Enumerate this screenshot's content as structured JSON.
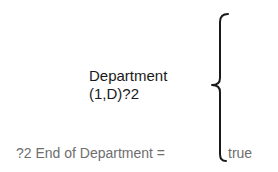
{
  "diagram": {
    "group_label": {
      "name": "Department",
      "repetition": "(1,D)?2"
    },
    "end_condition": {
      "label": "?2 End of Department =",
      "value": "true"
    },
    "brace": {
      "type": "left-curly-brace",
      "color": "#1a1a1a"
    },
    "colors": {
      "primary_text": "#1a1a1a",
      "secondary_text": "#6e6e6e",
      "background": "#ffffff"
    }
  }
}
